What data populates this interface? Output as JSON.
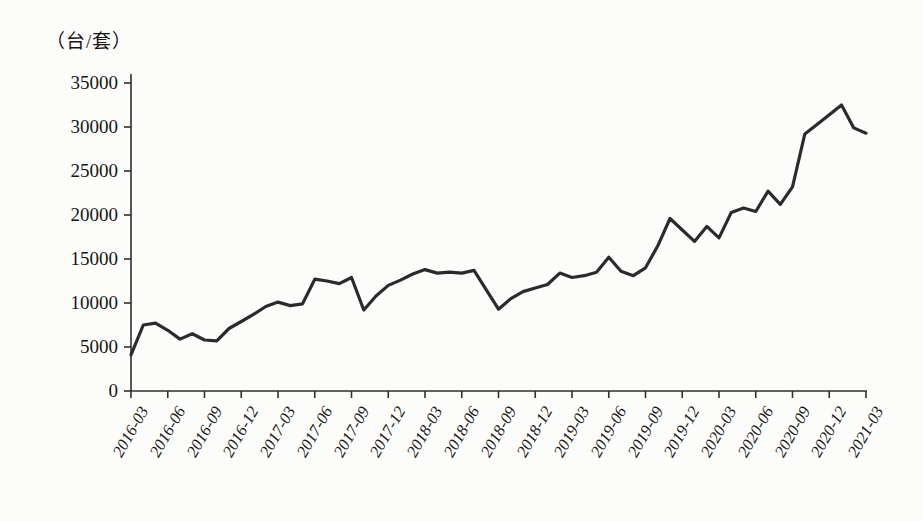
{
  "figure": {
    "background_color": "#fcfcfb",
    "line_color": "#2b2b2b",
    "axis_color": "#2f2f2f",
    "unit_label": "（台/套）"
  },
  "chart_data": {
    "type": "line",
    "title": "",
    "xlabel": "",
    "ylabel": "（台/套）",
    "ylim": [
      0,
      35000
    ],
    "y_ticks": [
      0,
      5000,
      10000,
      15000,
      20000,
      25000,
      30000,
      35000
    ],
    "grid": false,
    "legend": "none",
    "x_tick_labels": [
      "2016-03",
      "2016-06",
      "2016-09",
      "2016-12",
      "2017-03",
      "2017-06",
      "2017-09",
      "2017-12",
      "2018-03",
      "2018-06",
      "2018-09",
      "2018-12",
      "2019-03",
      "2019-06",
      "2019-09",
      "2019-12",
      "2020-03",
      "2020-06",
      "2020-09",
      "2020-12",
      "2021-03"
    ],
    "x_tick_every_months": 3,
    "series": [
      {
        "name": "月度产量（台/套）",
        "x": [
          "2016-03",
          "2016-04",
          "2016-05",
          "2016-06",
          "2016-07",
          "2016-08",
          "2016-09",
          "2016-10",
          "2016-11",
          "2016-12",
          "2017-01",
          "2017-02",
          "2017-03",
          "2017-04",
          "2017-05",
          "2017-06",
          "2017-07",
          "2017-08",
          "2017-09",
          "2017-10",
          "2017-11",
          "2017-12",
          "2018-01",
          "2018-02",
          "2018-03",
          "2018-04",
          "2018-05",
          "2018-06",
          "2018-07",
          "2018-08",
          "2018-09",
          "2018-10",
          "2018-11",
          "2018-12",
          "2019-01",
          "2019-02",
          "2019-03",
          "2019-04",
          "2019-05",
          "2019-06",
          "2019-07",
          "2019-08",
          "2019-09",
          "2019-10",
          "2019-11",
          "2019-12",
          "2020-01",
          "2020-02",
          "2020-03",
          "2020-04",
          "2020-05",
          "2020-06",
          "2020-07",
          "2020-08",
          "2020-09",
          "2020-10",
          "2020-11",
          "2020-12",
          "2021-01",
          "2021-02",
          "2021-03"
        ],
        "values": [
          4100,
          7500,
          7700,
          6900,
          5900,
          6500,
          5800,
          5700,
          7100,
          7900,
          8700,
          9600,
          10100,
          9700,
          9900,
          12700,
          12500,
          12200,
          12900,
          9200,
          10800,
          12000,
          12600,
          13300,
          13800,
          13400,
          13500,
          13400,
          13700,
          11500,
          9300,
          10500,
          11300,
          11700,
          12100,
          13400,
          12900,
          13100,
          13500,
          15200,
          13600,
          13100,
          14000,
          16500,
          19600,
          18300,
          17000,
          18700,
          17400,
          20300,
          20800,
          20400,
          22700,
          21200,
          23200,
          29200,
          30300,
          31400,
          32500,
          29900,
          29300
        ]
      }
    ]
  }
}
